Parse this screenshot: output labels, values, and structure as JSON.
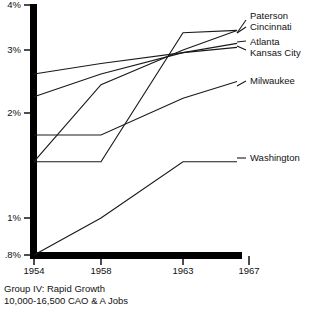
{
  "chart_data": {
    "type": "line",
    "title": "Group IV: Rapid Growth",
    "subtitle": "10,000-16,500 CAO & A Jobs",
    "xlabel": "",
    "ylabel": "",
    "x": [
      1954,
      1958,
      1963,
      1967
    ],
    "xticklabels": [
      "1954",
      "1958",
      "1963",
      "1967"
    ],
    "yticklabels": [
      ".8%",
      "1%",
      "2%",
      "3%",
      "4%"
    ],
    "ytickvalues": [
      0.8,
      1,
      2,
      3,
      4
    ],
    "ylim": [
      0.8,
      4
    ],
    "yscale": "log",
    "grid": false,
    "legend_position": "right-inline-labels",
    "series": [
      {
        "name": "Paterson",
        "values": [
          1.45,
          1.45,
          3.35,
          3.4
        ]
      },
      {
        "name": "Cincinnati",
        "values": [
          1.45,
          2.4,
          3.0,
          3.4
        ]
      },
      {
        "name": "Atlanta",
        "values": [
          2.22,
          2.57,
          2.95,
          3.13
        ]
      },
      {
        "name": "Kansas City",
        "values": [
          2.57,
          2.75,
          2.95,
          3.05
        ]
      },
      {
        "name": "Milwaukee",
        "values": [
          1.73,
          1.73,
          2.2,
          2.45
        ]
      },
      {
        "name": "Washington",
        "values": [
          0.8,
          1.0,
          1.45,
          1.45
        ]
      }
    ]
  },
  "axis": {
    "yticks": [
      {
        "label": "4%",
        "top": 0,
        "right": 291
      },
      {
        "label": "3%",
        "top": 45,
        "right": 291
      },
      {
        "label": "2%",
        "top": 108,
        "right": 291
      },
      {
        "label": "1%",
        "top": 213,
        "right": 291
      },
      {
        "label": ".8%",
        "top": 250,
        "right": 288
      }
    ],
    "xticks": [
      {
        "label": "1954",
        "left": 18,
        "top": 266
      },
      {
        "label": "1958",
        "left": 85,
        "top": 266
      },
      {
        "label": "1963",
        "left": 167,
        "top": 266
      },
      {
        "label": "1967",
        "left": 233,
        "top": 266
      }
    ]
  },
  "series_labels": [
    {
      "name": "Paterson",
      "left": 250,
      "top": 11
    },
    {
      "name": "Cincinnati",
      "left": 250,
      "top": 22
    },
    {
      "name": "Atlanta",
      "left": 250,
      "top": 37
    },
    {
      "name": "Kansas City",
      "left": 250,
      "top": 48
    },
    {
      "name": "Milwaukee",
      "left": 250,
      "top": 76
    },
    {
      "name": "Washington",
      "left": 250,
      "top": 153
    }
  ],
  "caption": {
    "line1": "Group IV: Rapid Growth",
    "line2": "10,000-16,500 CAO & A Jobs"
  },
  "colors": {
    "ink": "#1a1a1a",
    "axis": "#000000",
    "background": "#ffffff"
  }
}
